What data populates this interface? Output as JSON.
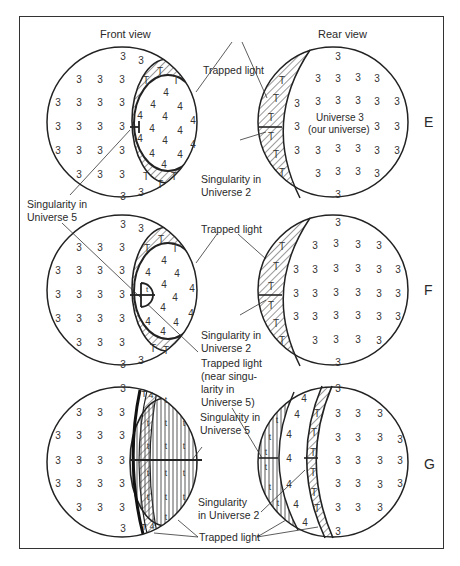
{
  "headings": {
    "front": "Front view",
    "rear": "Rear view"
  },
  "rows": [
    {
      "tag": "E",
      "labels": {
        "trapped_light": "Trapped light",
        "singularity_u2": [
          "Singularity in",
          "Universe 2"
        ],
        "singularity_u5": [
          "Singularity in",
          "Universe 5"
        ],
        "universe3": [
          "Universe 3",
          "(our universe)"
        ]
      }
    },
    {
      "tag": "F",
      "labels": {
        "trapped_light": "Trapped light",
        "singularity_u2": [
          "Singularity in",
          "Universe 2"
        ],
        "trapped_near": [
          "Trapped light",
          "(near singu-",
          "larity in",
          "Universe 5)"
        ]
      }
    },
    {
      "tag": "G",
      "labels": {
        "singularity_u5": [
          "Singularity in",
          "Universe 5"
        ],
        "singularity_u2": [
          "Singularity",
          "in Universe 2"
        ],
        "trapped_light": "Trapped light"
      }
    }
  ],
  "region_symbols": {
    "universe3": "3",
    "universe4": "4",
    "trapped_T": "T",
    "trapped_t": "t"
  }
}
